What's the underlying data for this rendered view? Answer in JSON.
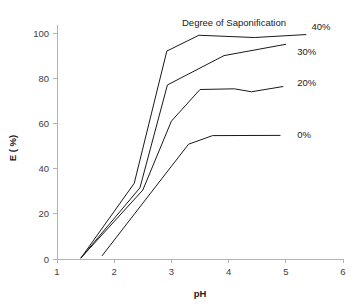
{
  "chart_data": {
    "type": "line",
    "title": "",
    "legend_title": "Degree of Saponification",
    "legend_position": "right-of-series-ends",
    "xlabel": "pH",
    "ylabel": "E ( %)",
    "xlim": [
      1,
      6
    ],
    "ylim": [
      0,
      100
    ],
    "xticks": [
      1,
      2,
      3,
      4,
      5,
      6
    ],
    "yticks": [
      0,
      20,
      40,
      60,
      80,
      100
    ],
    "xtick_labels": [
      "1",
      "2",
      "3",
      "4",
      "5",
      "6"
    ],
    "ytick_labels": [
      "0",
      "20",
      "40",
      "60",
      "80",
      "100"
    ],
    "grid": false,
    "line_color": "#1a1a1a",
    "axis_color": "#b3b3b3",
    "series": [
      {
        "name": "40%",
        "label": "40%",
        "label_x": 5.45,
        "label_y": 103,
        "x": [
          1.42,
          2.35,
          2.92,
          3.48,
          4.45,
          5.35
        ],
        "y": [
          0.5,
          33.5,
          92.0,
          99.0,
          98.0,
          99.3
        ]
      },
      {
        "name": "30%",
        "label": "30%",
        "label_x": 5.2,
        "label_y": 92,
        "x": [
          1.42,
          2.45,
          2.93,
          3.92,
          5.0
        ],
        "y": [
          0.5,
          31.5,
          77.0,
          90.0,
          95.0
        ]
      },
      {
        "name": "20%",
        "label": "20%",
        "label_x": 5.2,
        "label_y": 78,
        "x": [
          1.42,
          2.5,
          3.0,
          3.5,
          4.1,
          4.4,
          4.95
        ],
        "y": [
          0.5,
          30.5,
          61.0,
          75.0,
          75.3,
          74.0,
          76.3
        ]
      },
      {
        "name": "0%",
        "label": "0%",
        "label_x": 5.2,
        "label_y": 55,
        "x": [
          1.79,
          3.3,
          3.72,
          4.9
        ],
        "y": [
          1.5,
          50.8,
          54.6,
          54.7
        ]
      }
    ]
  }
}
